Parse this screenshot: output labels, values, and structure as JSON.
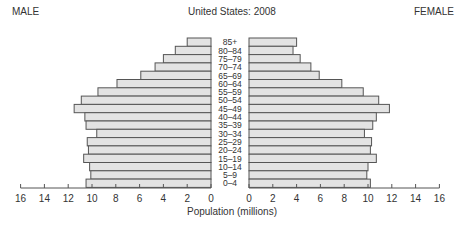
{
  "header": {
    "left_label": "MALE",
    "title": "United States: 2008",
    "right_label": "FEMALE"
  },
  "chart_data": {
    "type": "bar",
    "orientation": "horizontal",
    "subtype": "population-pyramid",
    "title": "United States: 2008",
    "xlabel": "Population (millions)",
    "ylabel": "",
    "categories": [
      "85+",
      "80–84",
      "75–79",
      "70–74",
      "65–69",
      "60–64",
      "55–59",
      "50–54",
      "45–49",
      "40–44",
      "35–39",
      "30–34",
      "25–29",
      "20–24",
      "15–19",
      "10–14",
      "5–9",
      "0–4"
    ],
    "series": [
      {
        "name": "MALE",
        "side": "left",
        "values": [
          2.0,
          3.0,
          4.0,
          4.7,
          5.9,
          7.9,
          9.5,
          10.9,
          11.5,
          10.6,
          10.5,
          9.6,
          10.4,
          10.3,
          10.7,
          10.2,
          10.1,
          10.5
        ]
      },
      {
        "name": "FEMALE",
        "side": "right",
        "values": [
          4.0,
          3.7,
          4.3,
          5.2,
          5.9,
          7.8,
          9.6,
          10.9,
          11.8,
          10.7,
          10.4,
          9.7,
          10.3,
          10.2,
          10.7,
          10.0,
          9.9,
          10.2
        ]
      }
    ],
    "xlim": [
      0,
      16
    ],
    "xticks": [
      0,
      2,
      4,
      6,
      8,
      10,
      12,
      14,
      16
    ],
    "grid": false,
    "legend": "none (side labels MALE / FEMALE at top corners)",
    "colors": {
      "bar_fill": "#e3e3e3",
      "bar_stroke": "#555555",
      "text": "#333333"
    }
  }
}
